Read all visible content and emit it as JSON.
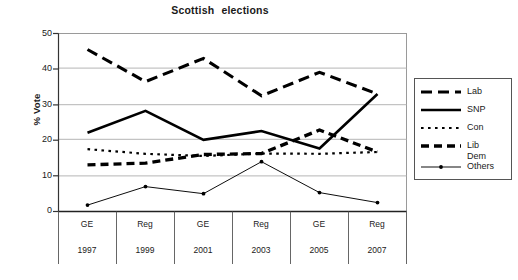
{
  "chart_data": {
    "type": "line",
    "title": "Scottish  elections",
    "xlabel": "",
    "ylabel": "% Vote",
    "ylim": [
      0,
      50
    ],
    "yticks": [
      0,
      10,
      20,
      30,
      40,
      50
    ],
    "grid": true,
    "legend_position": "right",
    "categories": [
      "GE 1997",
      "Reg 1999",
      "GE 2001",
      "Reg 2003",
      "GE 2005",
      "Reg 2007"
    ],
    "category_rows": {
      "type": [
        "GE",
        "Reg",
        "GE",
        "Reg",
        "GE",
        "Reg"
      ],
      "year": [
        "1997",
        "1999",
        "2001",
        "2003",
        "2005",
        "2007"
      ]
    },
    "series": [
      {
        "name": "Lab",
        "style": "long-dash",
        "values": [
          45.5,
          36.5,
          43.0,
          32.5,
          39.1,
          33.0
        ]
      },
      {
        "name": "SNP",
        "style": "solid",
        "values": [
          22.1,
          28.3,
          20.1,
          22.6,
          17.7,
          33.0
        ]
      },
      {
        "name": "Con",
        "style": "dotted",
        "values": [
          17.5,
          16.2,
          15.6,
          16.3,
          16.2,
          16.7
        ]
      },
      {
        "name": "Lib Dem",
        "style": "thick-dash",
        "values": [
          13.1,
          13.6,
          16.0,
          16.3,
          22.9,
          16.7
        ]
      },
      {
        "name": "Others",
        "style": "thin-marker",
        "values": [
          1.8,
          7.0,
          5.0,
          14.0,
          5.3,
          2.5
        ]
      }
    ]
  },
  "legend": {
    "entries": [
      {
        "label": "Lab",
        "label2": ""
      },
      {
        "label": "SNP",
        "label2": ""
      },
      {
        "label": "Con",
        "label2": ""
      },
      {
        "label": "Lib",
        "label2": "Dem"
      },
      {
        "label": "Others",
        "label2": ""
      }
    ]
  },
  "colors": {
    "series": "#000000",
    "grid": "#b5b5b5",
    "axis": "#333333",
    "text": "#1a1a1a"
  }
}
